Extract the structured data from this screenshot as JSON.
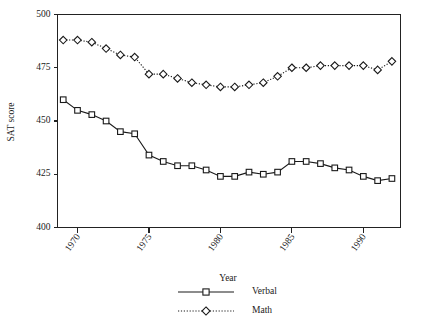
{
  "chart_data": {
    "type": "line",
    "title": "",
    "xlabel": "Year",
    "ylabel": "SAT score",
    "xlim": [
      1968.6,
      1992.6
    ],
    "ylim": [
      400,
      500
    ],
    "grid": false,
    "legend_position": "bottom-center",
    "xticks": [
      1970,
      1975,
      1980,
      1985,
      1990
    ],
    "xtick_labels": [
      "1970",
      "1975",
      "1980",
      "1985",
      "1990"
    ],
    "yticks": [
      400,
      425,
      450,
      475,
      500
    ],
    "ytick_labels": [
      "400",
      "425",
      "450",
      "475",
      "500"
    ],
    "x": [
      1969,
      1970,
      1971,
      1972,
      1973,
      1974,
      1975,
      1976,
      1977,
      1978,
      1979,
      1980,
      1981,
      1982,
      1983,
      1984,
      1985,
      1986,
      1987,
      1988,
      1989,
      1990,
      1991,
      1992
    ],
    "series": [
      {
        "name": "Verbal",
        "marker": "square",
        "linestyle": "solid",
        "color": "#1a1a1a",
        "values": [
          460,
          455,
          453,
          450,
          445,
          444,
          434,
          431,
          429,
          429,
          427,
          424,
          424,
          426,
          425,
          426,
          431,
          431,
          430,
          428,
          427,
          424,
          422,
          423
        ]
      },
      {
        "name": "Math",
        "marker": "diamond",
        "linestyle": "dotted",
        "color": "#1a1a1a",
        "values": [
          488,
          488,
          487,
          484,
          481,
          480,
          472,
          472,
          470,
          468,
          467,
          466,
          466,
          467,
          468,
          471,
          475,
          475,
          476,
          476,
          476,
          476,
          474,
          478
        ]
      }
    ]
  },
  "legend": {
    "entries": [
      {
        "label": "Verbal"
      },
      {
        "label": "Math"
      }
    ]
  }
}
